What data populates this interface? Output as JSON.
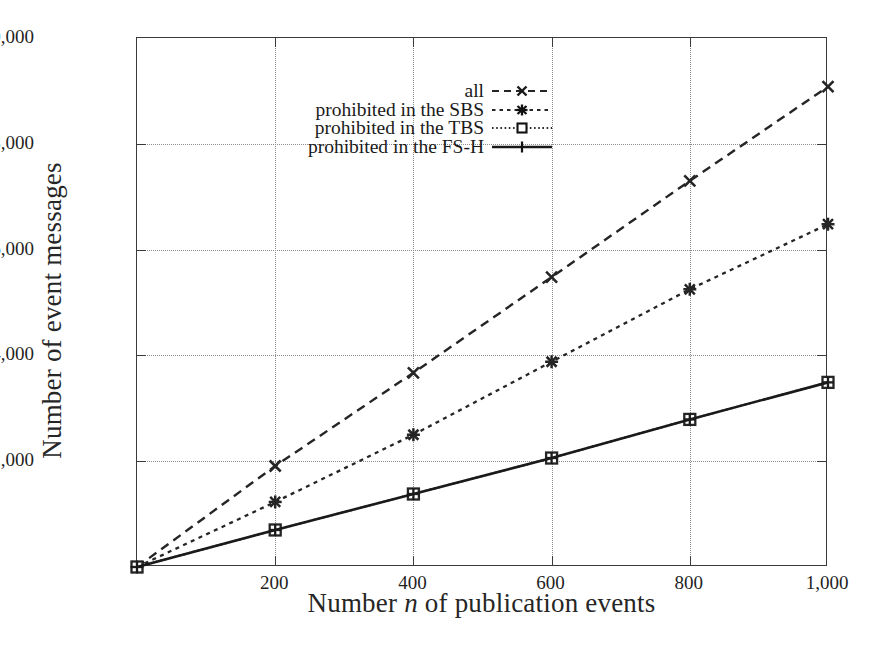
{
  "chart_data": {
    "type": "line",
    "title": "",
    "xlabel": "Number n of publication events",
    "xlabel_plain": "Number",
    "xlabel_italic": "n",
    "xlabel_rest": "of publication events",
    "ylabel": "Number of event messages",
    "x": [
      0,
      200,
      400,
      600,
      800,
      1000
    ],
    "xlim": [
      0,
      1000
    ],
    "ylim": [
      0,
      10000
    ],
    "xticks": [
      200,
      400,
      600,
      800,
      1000
    ],
    "xticklabels": [
      "200",
      "400",
      "600",
      "800",
      "1,000"
    ],
    "yticks": [
      0,
      2000,
      4000,
      6000,
      8000,
      10000
    ],
    "yticklabels": [
      "2,000",
      "4,000",
      "6,000",
      "8,000",
      "10,000"
    ],
    "grid": true,
    "grid_style": "dotted",
    "legend_position": "top-center-inside",
    "series": [
      {
        "name": "all",
        "values": [
          0,
          1910,
          3670,
          5480,
          7300,
          9080
        ],
        "marker": "cross-x",
        "linestyle": "dashed",
        "color": "#252525"
      },
      {
        "name": "prohibited in the SBS",
        "values": [
          0,
          1230,
          2500,
          3880,
          5250,
          6480
        ],
        "marker": "star-filled",
        "linestyle": "dotted-dash",
        "color": "#252525"
      },
      {
        "name": "prohibited in the TBS",
        "values": [
          0,
          700,
          1380,
          2060,
          2790,
          3490
        ],
        "marker": "square-open",
        "linestyle": "fine-dotted",
        "color": "#252525"
      },
      {
        "name": "prohibited in the FS-H",
        "values": [
          0,
          700,
          1380,
          2060,
          2790,
          3490
        ],
        "marker": "plus",
        "linestyle": "solid",
        "color": "#1a1a1a"
      }
    ]
  },
  "legend": {
    "items": [
      {
        "label": "all"
      },
      {
        "label": "prohibited in the SBS"
      },
      {
        "label": "prohibited in the TBS"
      },
      {
        "label": "prohibited in the FS-H"
      }
    ]
  },
  "colors": {
    "frame": "#3a3a3a",
    "grid": "#8d8d8d",
    "ink": "#1f1f1f",
    "background": "#ffffff"
  }
}
